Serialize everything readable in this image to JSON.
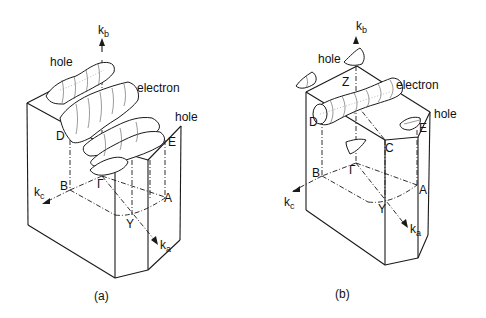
{
  "figure": {
    "panels": [
      {
        "id": "a",
        "caption": "(a)",
        "axes": {
          "kb": "k",
          "kb_sub": "b",
          "ka": "k",
          "ka_sub": "a",
          "kc": "k",
          "kc_sub": "c"
        },
        "points": {
          "gamma": "Γ",
          "B": "B",
          "A": "A",
          "Y": "Y",
          "D": "D",
          "E": "E"
        },
        "surface_labels": {
          "hole_top": "hole",
          "electron": "electron",
          "hole_right": "hole"
        }
      },
      {
        "id": "b",
        "caption": "(b)",
        "axes": {
          "kb": "k",
          "kb_sub": "b",
          "ka": "k",
          "ka_sub": "a",
          "kc": "k",
          "kc_sub": "c"
        },
        "points": {
          "gamma": "Γ",
          "B": "B",
          "A": "A",
          "Y": "Y",
          "D": "D",
          "E": "E",
          "Z": "Z",
          "C": "C"
        },
        "surface_labels": {
          "hole_top": "hole",
          "electron": "electron",
          "hole_right": "hole"
        }
      }
    ]
  }
}
